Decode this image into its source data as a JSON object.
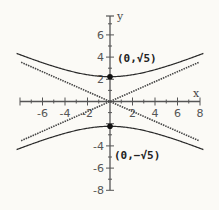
{
  "chart_data": {
    "type": "line",
    "title": "",
    "xlabel": "x",
    "ylabel": "y",
    "xlim": [
      -8,
      8
    ],
    "ylim": [
      -8,
      7.5
    ],
    "x_ticks": [
      -6,
      -4,
      -2,
      2,
      4,
      6,
      8
    ],
    "y_ticks": [
      -8,
      -6,
      -4,
      2,
      4,
      6
    ],
    "grid": false,
    "equation": "y^2/5 - x^2/25 = 1",
    "series": [
      {
        "name": "hyperbola upper branch",
        "style": "solid",
        "x": [
          -8,
          -6,
          -4,
          -2,
          0,
          2,
          4,
          6,
          8
        ],
        "y": [
          4.22,
          3.49,
          2.86,
          2.41,
          2.236,
          2.41,
          2.86,
          3.49,
          4.22
        ]
      },
      {
        "name": "hyperbola lower branch",
        "style": "solid",
        "x": [
          -8,
          -6,
          -4,
          -2,
          0,
          2,
          4,
          6,
          8
        ],
        "y": [
          -4.22,
          -3.49,
          -2.86,
          -2.41,
          -2.236,
          -2.41,
          -2.86,
          -3.49,
          -4.22
        ]
      },
      {
        "name": "asymptote y = x/sqrt5",
        "style": "dotted",
        "x": [
          -8,
          8
        ],
        "y": [
          -3.58,
          3.58
        ]
      },
      {
        "name": "asymptote y = -x/sqrt5",
        "style": "dotted",
        "x": [
          -8,
          8
        ],
        "y": [
          3.58,
          -3.58
        ]
      }
    ],
    "points": [
      {
        "x": 0,
        "y": 2.236,
        "label": "(0,√5)"
      },
      {
        "x": 0,
        "y": -2.236,
        "label": "(0,−√5)"
      }
    ]
  },
  "labels": {
    "x_axis": "x",
    "y_axis": "y",
    "x_ticks": [
      "-6",
      "-4",
      "-2",
      "2",
      "4",
      "6",
      "8"
    ],
    "y_ticks": [
      "6",
      "4",
      "2",
      "-4",
      "-6",
      "-8"
    ],
    "top_vertex": "(0,√5)",
    "bottom_vertex": "(0,−√5)"
  },
  "colors": {
    "background": "#fbfaf6",
    "curve": "#2a2a2a",
    "asymptote": "#444444",
    "axis": "#555555"
  }
}
